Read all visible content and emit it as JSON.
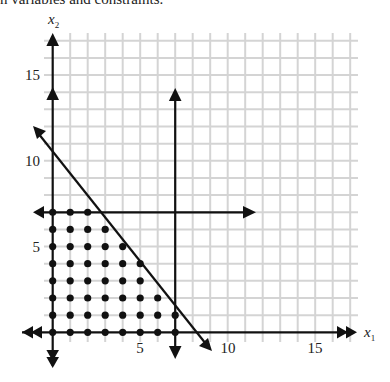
{
  "caption": "n variables and constraints.",
  "chart_data": {
    "type": "scatter",
    "title": "",
    "xlabel": "x1",
    "ylabel": "x2",
    "xlim": [
      0,
      17
    ],
    "ylim": [
      0,
      17
    ],
    "grid": true,
    "x_ticks": [
      "5",
      "10",
      "15"
    ],
    "y_ticks": [
      "5",
      "10",
      "15"
    ],
    "constraint_lines": [
      {
        "name": "x1 = 7",
        "type": "vertical",
        "x": 7
      },
      {
        "name": "x2 = 7",
        "type": "horizontal",
        "y": 7
      },
      {
        "name": "diagonal constraint",
        "type": "line",
        "x_intercept": 8.2,
        "y_intercept": 10.8
      }
    ],
    "feasible_integer_points": [
      {
        "x2": 7,
        "x1": [
          0,
          1,
          2
        ]
      },
      {
        "x2": 6,
        "x1": [
          0,
          1,
          2,
          3
        ]
      },
      {
        "x2": 5,
        "x1": [
          0,
          1,
          2,
          3,
          4
        ]
      },
      {
        "x2": 4,
        "x1": [
          0,
          1,
          2,
          3,
          4,
          5
        ]
      },
      {
        "x2": 3,
        "x1": [
          0,
          1,
          2,
          3,
          4,
          5
        ]
      },
      {
        "x2": 2,
        "x1": [
          0,
          1,
          2,
          3,
          4,
          5,
          6
        ]
      },
      {
        "x2": 1,
        "x1": [
          0,
          1,
          2,
          3,
          4,
          5,
          6,
          7
        ]
      },
      {
        "x2": 0,
        "x1": [
          0,
          1,
          2,
          3,
          4,
          5,
          6,
          7
        ]
      }
    ]
  },
  "axes": {
    "x_label_main": "x",
    "x_label_sub": "1",
    "y_label_main": "x",
    "y_label_sub": "2",
    "x_tick_5": "5",
    "x_tick_10": "10",
    "x_tick_15": "15",
    "y_tick_5": "5",
    "y_tick_10": "10",
    "y_tick_15": "15"
  },
  "colors": {
    "grid": "#d4d4d4",
    "ink": "#111111"
  }
}
